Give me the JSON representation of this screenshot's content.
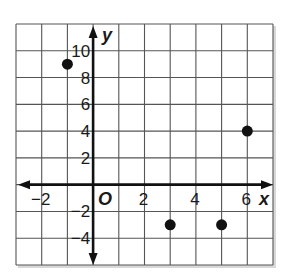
{
  "chart_data": {
    "type": "scatter",
    "title": "",
    "xlabel": "x",
    "ylabel": "y",
    "origin_label": "O",
    "xlim": [
      -3,
      7
    ],
    "ylim": [
      -6,
      12
    ],
    "grid": true,
    "x_grid_step": 1,
    "y_grid_step": 2,
    "x_ticks": [
      -2,
      2,
      4,
      6
    ],
    "x_tick_labels": [
      "−2",
      "2",
      "4",
      "6"
    ],
    "y_ticks": [
      10,
      8,
      6,
      4,
      2,
      -2,
      -4
    ],
    "y_tick_labels": [
      "10",
      "8",
      "6",
      "4",
      "2",
      "−2",
      "−4"
    ],
    "series": [
      {
        "name": "points",
        "points": [
          {
            "x": -1,
            "y": 9
          },
          {
            "x": 3,
            "y": -3
          },
          {
            "x": 5,
            "y": -3
          },
          {
            "x": 6,
            "y": 4
          }
        ]
      }
    ],
    "colors": {
      "grid": "#555555",
      "axis": "#111111",
      "point": "#111111",
      "border_shadow": "#d8d8d8"
    }
  }
}
